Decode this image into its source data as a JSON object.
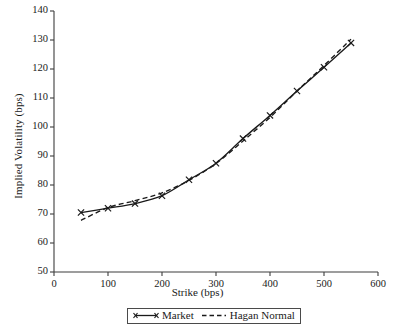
{
  "chart_data": {
    "type": "line",
    "title": "",
    "xlabel": "Strike (bps)",
    "ylabel": "Implied Volatility (bps)",
    "xlim": [
      0,
      600
    ],
    "ylim": [
      50,
      140
    ],
    "xticks": [
      0,
      100,
      200,
      300,
      400,
      500,
      600
    ],
    "yticks": [
      50,
      60,
      70,
      80,
      90,
      100,
      110,
      120,
      130,
      140
    ],
    "grid": false,
    "legend_position": "bottom-center",
    "x": [
      50,
      100,
      150,
      200,
      250,
      300,
      350,
      400,
      450,
      500,
      550
    ],
    "series": [
      {
        "name": "Market",
        "style": "solid",
        "marker": "x",
        "color": "#1a1a1a",
        "values": [
          70.5,
          72.0,
          73.6,
          76.3,
          81.8,
          87.5,
          96.0,
          104.0,
          112.4,
          120.6,
          129.0
        ]
      },
      {
        "name": "Hagan Normal",
        "style": "dashed",
        "marker": "none",
        "color": "#1a1a1a",
        "values": [
          67.8,
          72.2,
          74.6,
          77.3,
          81.6,
          87.4,
          95.2,
          103.3,
          112.4,
          121.2,
          130.3
        ]
      }
    ]
  },
  "axes": {
    "x_tick_labels": [
      "0",
      "100",
      "200",
      "300",
      "400",
      "500",
      "600"
    ],
    "y_tick_labels": [
      "50",
      "60",
      "70",
      "80",
      "90",
      "100",
      "110",
      "120",
      "130",
      "140"
    ],
    "x_title": "Strike (bps)",
    "y_title": "Implied Volatility (bps)"
  },
  "legend": {
    "items": [
      {
        "label": "Market"
      },
      {
        "label": "Hagan Normal"
      }
    ]
  },
  "colors": {
    "axis": "#3d3d3d",
    "series": "#1a1a1a",
    "background": "#ffffff"
  }
}
